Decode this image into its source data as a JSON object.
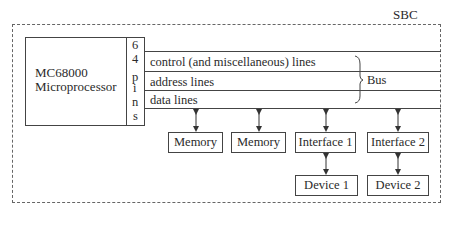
{
  "diagram": {
    "container_label": "SBC",
    "processor": {
      "line1": "MC68000",
      "line2": "Microprocessor",
      "pins_chars": [
        "6",
        "4",
        "p",
        "i",
        "n",
        "s"
      ]
    },
    "bus_lines": [
      {
        "label": "control (and miscellaneous) lines"
      },
      {
        "label": "address lines"
      },
      {
        "label": "data lines"
      }
    ],
    "bus_label": "Bus",
    "components": [
      {
        "label": "Memory"
      },
      {
        "label": "Memory"
      },
      {
        "label": "Interface 1"
      },
      {
        "label": "Interface 2"
      }
    ],
    "devices": [
      {
        "label": "Device 1"
      },
      {
        "label": "Device 2"
      }
    ],
    "colors": {
      "line": "#444444",
      "dash": "#666666",
      "text": "#2a2a2a"
    }
  }
}
